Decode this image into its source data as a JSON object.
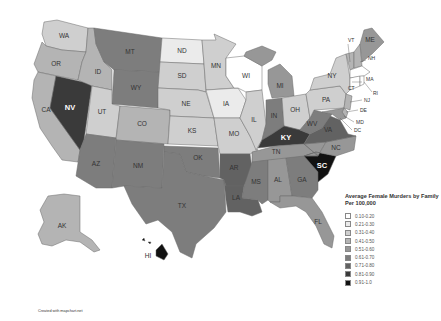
{
  "legend": {
    "title": "Average Female Murders by Family Per 100,000",
    "bins": [
      {
        "label": "0.10-0.20",
        "color": "#ffffff"
      },
      {
        "label": "0.21-0.30",
        "color": "#ebebeb"
      },
      {
        "label": "0.31-0.40",
        "color": "#cfcfcf"
      },
      {
        "label": "0.41-0.50",
        "color": "#b4b4b4"
      },
      {
        "label": "0.51-0.60",
        "color": "#979797"
      },
      {
        "label": "0.61-0.70",
        "color": "#7d7d7d"
      },
      {
        "label": "0.71-0.80",
        "color": "#626262"
      },
      {
        "label": "0.81-0.90",
        "color": "#3a3a3a"
      },
      {
        "label": "0.91-1.0",
        "color": "#111111"
      }
    ]
  },
  "credit": "Created with mapchart.net",
  "states": {
    "WA": {
      "label": "WA",
      "bin": "0.31-0.40"
    },
    "OR": {
      "label": "OR",
      "bin": "0.41-0.50"
    },
    "CA": {
      "label": "CA",
      "bin": "0.41-0.50"
    },
    "NV": {
      "label": "NV",
      "bin": "0.81-0.90"
    },
    "ID": {
      "label": "ID",
      "bin": "0.41-0.50"
    },
    "MT": {
      "label": "MT",
      "bin": "0.61-0.70"
    },
    "WY": {
      "label": "WY",
      "bin": "0.61-0.70"
    },
    "UT": {
      "label": "UT",
      "bin": "0.31-0.40"
    },
    "CO": {
      "label": "CO",
      "bin": "0.41-0.50"
    },
    "AZ": {
      "label": "AZ",
      "bin": "0.61-0.70"
    },
    "NM": {
      "label": "NM",
      "bin": "0.61-0.70"
    },
    "ND": {
      "label": "ND",
      "bin": "0.21-0.30"
    },
    "SD": {
      "label": "SD",
      "bin": "0.31-0.40"
    },
    "NE": {
      "label": "NE",
      "bin": "0.31-0.40"
    },
    "KS": {
      "label": "KS",
      "bin": "0.31-0.40"
    },
    "OK": {
      "label": "OK",
      "bin": "0.61-0.70"
    },
    "TX": {
      "label": "TX",
      "bin": "0.61-0.70"
    },
    "MN": {
      "label": "MN",
      "bin": "0.31-0.40"
    },
    "IA": {
      "label": "IA",
      "bin": "0.21-0.30"
    },
    "MO": {
      "label": "MO",
      "bin": "0.31-0.40"
    },
    "AR": {
      "label": "AR",
      "bin": "0.71-0.80"
    },
    "LA": {
      "label": "LA",
      "bin": "0.71-0.80"
    },
    "WI": {
      "label": "WI",
      "bin": "0.10-0.20"
    },
    "IL": {
      "label": "IL",
      "bin": "0.31-0.40"
    },
    "MI": {
      "label": "MI",
      "bin": "0.51-0.60"
    },
    "IN": {
      "label": "IN",
      "bin": "0.61-0.70"
    },
    "OH": {
      "label": "OH",
      "bin": "0.31-0.40"
    },
    "KY": {
      "label": "KY",
      "bin": "0.81-0.90"
    },
    "TN": {
      "label": "TN",
      "bin": "0.51-0.60"
    },
    "MS": {
      "label": "MS",
      "bin": "0.61-0.70"
    },
    "AL": {
      "label": "AL",
      "bin": "0.51-0.60"
    },
    "GA": {
      "label": "GA",
      "bin": "0.61-0.70"
    },
    "FL": {
      "label": "FL",
      "bin": "0.51-0.60"
    },
    "SC": {
      "label": "SC",
      "bin": "0.91-1.0"
    },
    "NC": {
      "label": "NC",
      "bin": "0.51-0.60"
    },
    "VA": {
      "label": "VA",
      "bin": "0.71-0.80"
    },
    "WV": {
      "label": "WV",
      "bin": "0.61-0.70"
    },
    "PA": {
      "label": "PA",
      "bin": "0.31-0.40"
    },
    "NY": {
      "label": "NY",
      "bin": "0.31-0.40"
    },
    "NJ": {
      "label": "NJ",
      "bin": "0.41-0.50"
    },
    "DE": {
      "label": "DE",
      "bin": "0.41-0.50"
    },
    "MD": {
      "label": "MD",
      "bin": "0.51-0.60"
    },
    "DC": {
      "label": "DC",
      "bin": "0.51-0.60"
    },
    "CT": {
      "label": "CT",
      "bin": "0.10-0.20"
    },
    "RI": {
      "label": "RI",
      "bin": "0.10-0.20"
    },
    "MA": {
      "label": "MA",
      "bin": "0.10-0.20"
    },
    "VT": {
      "label": "VT",
      "bin": "0.41-0.50"
    },
    "NH": {
      "label": "NH",
      "bin": "0.41-0.50"
    },
    "ME": {
      "label": "ME",
      "bin": "0.51-0.60"
    },
    "AK": {
      "label": "AK",
      "bin": "0.41-0.50"
    },
    "HI": {
      "label": "HI",
      "bin": "0.91-1.0"
    }
  }
}
